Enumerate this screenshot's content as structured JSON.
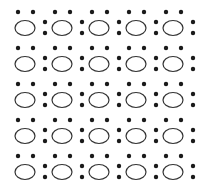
{
  "pattern": {
    "rows": 5,
    "cols": 5,
    "origin_x": 25,
    "origin_y": 28,
    "col_pitch": 37,
    "row_pitch": 36,
    "ellipse": {
      "rx": 10,
      "ry": 7.5,
      "stroke": "#333333",
      "stroke_width": 1.2,
      "fill": "#ffffff"
    },
    "top_dots": {
      "dx": [
        -7,
        8
      ],
      "dy": -16,
      "r": 2.2
    },
    "side_dots": {
      "dx": 20,
      "dy": [
        -6,
        5
      ],
      "r": 2.2
    },
    "dot_color": "#1a1a1a"
  }
}
